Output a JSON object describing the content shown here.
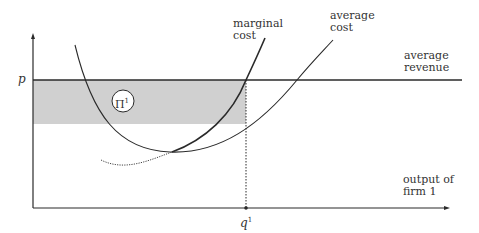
{
  "diagram": {
    "title": "",
    "axes": {
      "y_label_price": "p",
      "x_label_line1": "output of",
      "x_label_line2": "firm 1",
      "q_label": "q",
      "q_superscript": "1"
    },
    "curves": {
      "marginal_cost_line1": "marginal",
      "marginal_cost_line2": "cost",
      "average_cost_line1": "average",
      "average_cost_line2": "cost",
      "average_revenue_line1": "average",
      "average_revenue_line2": "revenue"
    },
    "profit_area": {
      "symbol": "Π",
      "superscript": "1"
    },
    "colors": {
      "line": "#2a2a2a",
      "shade": "#d0d0d0",
      "background": "#ffffff"
    }
  }
}
